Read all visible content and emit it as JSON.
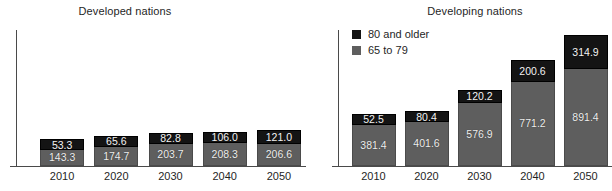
{
  "chart_data": [
    {
      "type": "bar",
      "title": "Developed nations",
      "stacked": true,
      "xlabel": "",
      "ylabel": "",
      "ylim": [
        0,
        1250
      ],
      "grid": false,
      "legend_position": "none",
      "categories": [
        "2010",
        "2020",
        "2030",
        "2040",
        "2050"
      ],
      "series": [
        {
          "name": "65 to 79",
          "color": "#5e5e5e",
          "values": [
            143.3,
            174.7,
            203.7,
            208.3,
            206.6
          ]
        },
        {
          "name": "80 and older",
          "color": "#141414",
          "values": [
            53.3,
            65.6,
            82.8,
            106.0,
            121.0
          ]
        }
      ]
    },
    {
      "type": "bar",
      "title": "Developing nations",
      "stacked": true,
      "xlabel": "",
      "ylabel": "",
      "ylim": [
        0,
        1250
      ],
      "grid": false,
      "legend_position": "top-left",
      "categories": [
        "2010",
        "2020",
        "2030",
        "2040",
        "2050"
      ],
      "series": [
        {
          "name": "65 to 79",
          "color": "#5e5e5e",
          "values": [
            381.4,
            401.6,
            576.9,
            771.2,
            891.4
          ]
        },
        {
          "name": "80 and older",
          "color": "#141414",
          "values": [
            52.5,
            80.4,
            120.2,
            200.6,
            314.9
          ]
        }
      ]
    }
  ],
  "legend": {
    "items": [
      {
        "label": "80 and older",
        "swatch": "dark"
      },
      {
        "label": "65 to 79",
        "swatch": "gray"
      }
    ]
  },
  "developed": {
    "title": "Developed nations",
    "ticks": [
      "2010",
      "2020",
      "2030",
      "2040",
      "2050"
    ],
    "bars": [
      {
        "year": "2010",
        "top_label": "53.3",
        "bottom_label": "143.3",
        "top": 53.3,
        "bottom": 143.3
      },
      {
        "year": "2020",
        "top_label": "65.6",
        "bottom_label": "174.7",
        "top": 65.6,
        "bottom": 174.7
      },
      {
        "year": "2030",
        "top_label": "82.8",
        "bottom_label": "203.7",
        "top": 82.8,
        "bottom": 203.7
      },
      {
        "year": "2040",
        "top_label": "106.0",
        "bottom_label": "208.3",
        "top": 106.0,
        "bottom": 208.3
      },
      {
        "year": "2050",
        "top_label": "121.0",
        "bottom_label": "206.6",
        "top": 121.0,
        "bottom": 206.6
      }
    ]
  },
  "developing": {
    "title": "Developing nations",
    "ticks": [
      "2010",
      "2020",
      "2030",
      "2040",
      "2050"
    ],
    "bars": [
      {
        "year": "2010",
        "top_label": "52.5",
        "bottom_label": "381.4",
        "top": 52.5,
        "bottom": 381.4
      },
      {
        "year": "2020",
        "top_label": "80.4",
        "bottom_label": "401.6",
        "top": 80.4,
        "bottom": 401.6
      },
      {
        "year": "2030",
        "top_label": "120.2",
        "bottom_label": "576.9",
        "top": 120.2,
        "bottom": 576.9
      },
      {
        "year": "2040",
        "top_label": "200.6",
        "bottom_label": "771.2",
        "top": 200.6,
        "bottom": 771.2
      },
      {
        "year": "2050",
        "top_label": "314.9",
        "bottom_label": "891.4",
        "top": 314.9,
        "bottom": 891.4
      }
    ]
  }
}
